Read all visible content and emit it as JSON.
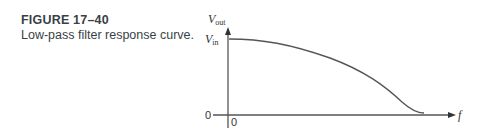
{
  "caption": {
    "figure_number": "FIGURE 17–40",
    "title": "Low-pass filter response curve."
  },
  "axes": {
    "y_label_main": "V",
    "y_label_sub": "out",
    "y_level_main": "V",
    "y_level_sub": "in",
    "y_zero": "0",
    "x_zero": "0",
    "x_label": "f"
  },
  "colors": {
    "line": "#555555",
    "text": "#3a3f47"
  }
}
